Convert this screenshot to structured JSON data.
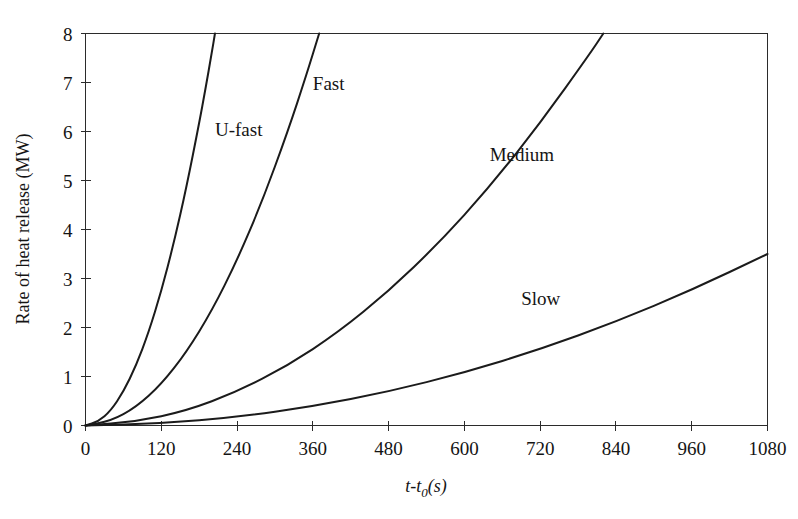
{
  "chart_data": {
    "type": "line",
    "title": "",
    "xlabel": "t-t0(s)",
    "xlabel_parts": {
      "main": "t-t",
      "sub": "0",
      "tail": "(s)"
    },
    "ylabel": "Rate of heat release (MW)",
    "xlim": [
      0,
      1080
    ],
    "ylim": [
      0,
      8
    ],
    "xticks": [
      0,
      120,
      240,
      360,
      480,
      600,
      720,
      840,
      960,
      1080
    ],
    "yticks": [
      0,
      1,
      2,
      3,
      4,
      5,
      6,
      7,
      8
    ],
    "xtick_labels": [
      "0",
      "120",
      "240",
      "360",
      "480",
      "600",
      "720",
      "840",
      "960",
      "1080"
    ],
    "ytick_labels": [
      "0",
      "1",
      "2",
      "3",
      "4",
      "5",
      "6",
      "7",
      "8"
    ],
    "grid": false,
    "legend_position": "inline-annotations",
    "series": [
      {
        "name": "U-fast",
        "label": "U-fast",
        "label_x": 205,
        "label_y": 5.9,
        "alpha_note": "Q = 8 MW at 205 s",
        "x": [
          0,
          20,
          40,
          60,
          80,
          100,
          120,
          140,
          160,
          180,
          190,
          200,
          205
        ],
        "y": [
          0.0,
          0.08,
          0.3,
          0.69,
          1.22,
          1.9,
          2.74,
          3.73,
          4.87,
          6.17,
          6.87,
          7.61,
          8.0
        ]
      },
      {
        "name": "Fast",
        "label": "Fast",
        "label_x": 360,
        "label_y": 6.85,
        "alpha_note": "Q = 8 MW at 370 s",
        "x": [
          0,
          40,
          80,
          120,
          160,
          200,
          240,
          280,
          320,
          350,
          370
        ],
        "y": [
          0.0,
          0.09,
          0.37,
          0.84,
          1.5,
          2.34,
          3.37,
          4.58,
          5.99,
          7.16,
          8.0
        ]
      },
      {
        "name": "Medium",
        "label": "Medium",
        "label_x": 640,
        "label_y": 5.4,
        "alpha_note": "Q = 8 MW at 820 s",
        "x": [
          0,
          80,
          160,
          240,
          320,
          400,
          480,
          560,
          640,
          720,
          800,
          820
        ],
        "y": [
          0.0,
          0.08,
          0.3,
          0.69,
          1.22,
          1.9,
          2.74,
          3.73,
          4.87,
          6.17,
          7.61,
          8.0
        ]
      },
      {
        "name": "Slow",
        "label": "Slow",
        "label_x": 690,
        "label_y": 2.45,
        "alpha_note": "Q = 3.5 MW at 1080 s",
        "x": [
          0,
          120,
          240,
          360,
          480,
          600,
          720,
          840,
          960,
          1080
        ],
        "y": [
          0.0,
          0.043,
          0.173,
          0.389,
          0.691,
          1.08,
          1.556,
          2.117,
          2.765,
          3.5
        ]
      }
    ],
    "colors": {
      "curve": "#1b1b1b",
      "axis": "#2b2b2b",
      "text": "#141414",
      "background": "#ffffff"
    }
  }
}
